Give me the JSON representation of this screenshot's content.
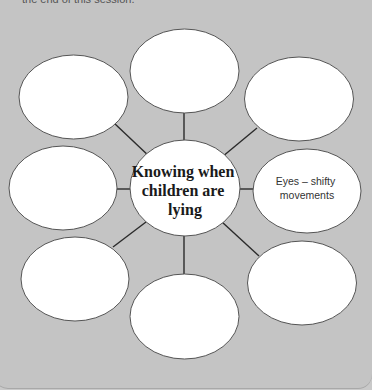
{
  "intro_text": "the end of this session.",
  "colors": {
    "background": "#c4c4c4",
    "bubble_fill": "#ffffff",
    "bubble_stroke": "#555555",
    "connector": "#2b2b2b"
  },
  "diagram": {
    "type": "spider-diagram",
    "center": {
      "lines": [
        "Knowing when",
        "children are",
        "lying"
      ]
    },
    "nodes": [
      {
        "position": "top",
        "lines": []
      },
      {
        "position": "top-right",
        "lines": []
      },
      {
        "position": "right",
        "lines": [
          "Eyes – shifty",
          "movements"
        ]
      },
      {
        "position": "bottom-right",
        "lines": []
      },
      {
        "position": "bottom",
        "lines": []
      },
      {
        "position": "bottom-left",
        "lines": []
      },
      {
        "position": "left",
        "lines": []
      },
      {
        "position": "top-left",
        "lines": []
      }
    ]
  }
}
